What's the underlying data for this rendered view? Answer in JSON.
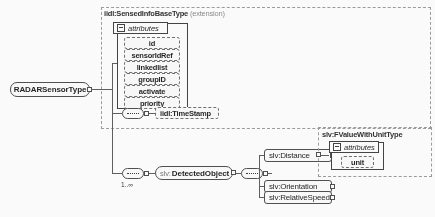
{
  "diagram": {
    "kind": "xml-schema-diagram",
    "root_node": {
      "name": "RADARSensorType"
    },
    "base_type_group": {
      "name": "iidl:SensedInfoBaseType",
      "qualifier": "(extension)"
    },
    "attributes_panel": {
      "header": "attributes",
      "items": [
        {
          "name": "id"
        },
        {
          "name": "sensorIdRef"
        },
        {
          "name": "linkedlist"
        },
        {
          "name": "groupID"
        },
        {
          "name": "activate"
        },
        {
          "name": "priority"
        }
      ]
    },
    "timestamp_element": {
      "prefix": "iidl:",
      "name": "TimeStamp"
    },
    "detected_object": {
      "prefix": "slv:",
      "name": "DetectedObject",
      "cardinality": "1..∞"
    },
    "children": [
      {
        "prefix": "slv:",
        "name": "Distance"
      },
      {
        "prefix": "slv:",
        "name": "Orientation"
      },
      {
        "prefix": "slv:",
        "name": "RelativeSpeed"
      }
    ],
    "value_type_group": {
      "name": "slv:FValueWithUnitType"
    },
    "value_attributes_panel": {
      "header": "attributes",
      "items": [
        {
          "name": "unit"
        }
      ]
    },
    "colors": {
      "line": "#5a5a5a",
      "box_border": "#4a4a4a",
      "dashed_border": "#9a9a9a",
      "background": "#ffffff"
    }
  }
}
